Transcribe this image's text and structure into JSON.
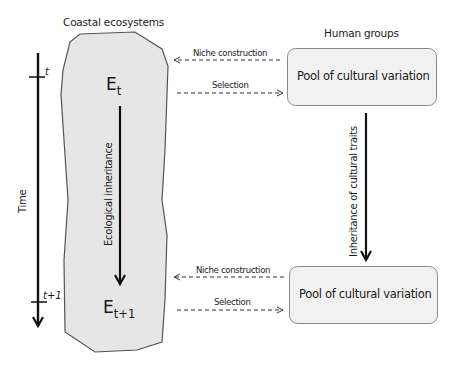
{
  "diagram": {
    "left_group": {
      "title": "Coastal ecosystems",
      "state_top": {
        "symbol": "E",
        "subscript": "t"
      },
      "state_bottom": {
        "symbol": "E",
        "subscript": "t+1"
      },
      "vertical_arrow_label": "Ecological inheritance",
      "fill_color": "#e6e6e6",
      "stroke_color": "#555555"
    },
    "right_group": {
      "title": "Human groups",
      "box_top_label": "Pool of cultural variation",
      "box_bottom_label": "Pool of cultural variation",
      "vertical_arrow_label": "Inheritance of cultural traits",
      "box_fill_color": "#f1f1f1",
      "box_stroke_color": "#8a8a8a"
    },
    "time_axis": {
      "label": "Time",
      "tick_top": "t",
      "tick_bottom": "t+1"
    },
    "connections": {
      "top": [
        {
          "label": "Niche construction",
          "direction": "right-to-left",
          "style": "dashed"
        },
        {
          "label": "Selection",
          "direction": "left-to-right",
          "style": "dashed"
        }
      ],
      "bottom": [
        {
          "label": "Niche construction",
          "direction": "right-to-left",
          "style": "dashed"
        },
        {
          "label": "Selection",
          "direction": "left-to-right",
          "style": "dashed"
        }
      ]
    }
  }
}
